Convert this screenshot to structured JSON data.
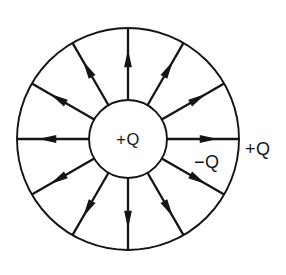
{
  "figure": {
    "name": "point-charge-in-spherical-shell-field-lines",
    "background_color": "#ffffff",
    "line_color": "#141414",
    "text_color": "#171717"
  },
  "geometry": {
    "center_x": 128,
    "center_y": 139,
    "outer_radius": 111,
    "inner_radius": 39,
    "ray_count": 12,
    "start_angle_deg": -90,
    "angle_step_deg": 30
  },
  "labels": {
    "center_charge": "+Q",
    "inner_surface_charge": "−Q",
    "outer_surface_charge": "+Q"
  },
  "label_positions": {
    "center_charge": {
      "x": 128,
      "y": 145,
      "anchor": "middle"
    },
    "inner_surface_charge": {
      "x": 194,
      "y": 168,
      "anchor": "start"
    },
    "outer_surface_charge": {
      "x": 245,
      "y": 155,
      "anchor": "start"
    }
  },
  "field_lines": [
    {
      "index": 0,
      "angle_deg": -90,
      "direction": "outward",
      "label": "field-line-up"
    },
    {
      "index": 1,
      "angle_deg": -60,
      "direction": "outward",
      "label": "field-line-up-right"
    },
    {
      "index": 2,
      "angle_deg": -30,
      "direction": "outward",
      "label": "field-line-right-up"
    },
    {
      "index": 3,
      "angle_deg": 0,
      "direction": "outward",
      "label": "field-line-right"
    },
    {
      "index": 4,
      "angle_deg": 30,
      "direction": "outward",
      "label": "field-line-right-down"
    },
    {
      "index": 5,
      "angle_deg": 60,
      "direction": "outward",
      "label": "field-line-down-right"
    },
    {
      "index": 6,
      "angle_deg": 90,
      "direction": "outward",
      "label": "field-line-down"
    },
    {
      "index": 7,
      "angle_deg": 120,
      "direction": "outward",
      "label": "field-line-down-left"
    },
    {
      "index": 8,
      "angle_deg": 150,
      "direction": "outward",
      "label": "field-line-left-down"
    },
    {
      "index": 9,
      "angle_deg": 180,
      "direction": "outward",
      "label": "field-line-left"
    },
    {
      "index": 10,
      "angle_deg": 210,
      "direction": "outward",
      "label": "field-line-left-up"
    },
    {
      "index": 11,
      "angle_deg": 240,
      "direction": "outward",
      "label": "field-line-up-left"
    }
  ]
}
